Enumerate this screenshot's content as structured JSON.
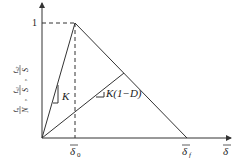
{
  "diagram": {
    "type": "bilinear traction-separation law",
    "y_axis_label": {
      "parts": [
        {
          "num": "t",
          "num_sub": "n",
          "den": "N"
        },
        {
          "num": "t",
          "num_sub": "s1",
          "den": "S"
        },
        {
          "num": "t",
          "num_sub": "s2",
          "den": "S"
        }
      ]
    },
    "y_tick": "1",
    "x_axis_label": "δ",
    "x_ticks": [
      {
        "label": "δ",
        "sub": "0"
      },
      {
        "label": "δ",
        "sub": "f"
      }
    ],
    "slope_labels": {
      "initial": "K",
      "damaged": "K(1−D)"
    },
    "colors": {
      "line": "#333333",
      "text": "#222222"
    }
  }
}
